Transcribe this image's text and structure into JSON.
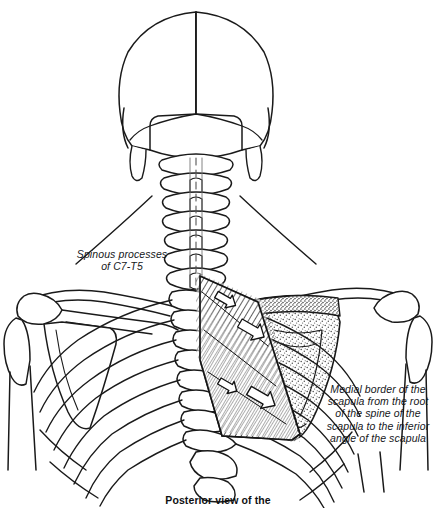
{
  "figure": {
    "view": "posterior",
    "medium": "black-and-white line drawing",
    "caption": "Posterior view of the",
    "caption_clipped": true,
    "labels": [
      {
        "id": "spinous-processes",
        "text": "Spinous processes\nof C7-T5",
        "style": "italic",
        "side": "left"
      },
      {
        "id": "medial-border",
        "text": "Medial border of the\nscapula from the root\nof the spine of the\nscapula to the inferior\nangle of the scapula",
        "style": "italic",
        "side": "right"
      }
    ],
    "structures": [
      "skull",
      "cervical vertebrae",
      "thoracic vertebrae",
      "ribs",
      "left scapula",
      "right scapula",
      "clavicle",
      "humerus",
      "rhomboid muscle"
    ],
    "muscle": {
      "name": "rhomboid",
      "rendering": "diagonal fiber hatching",
      "arrow_count": 4,
      "arrow_style": "white block arrow with black outline",
      "arrow_direction": "inferolateral, from spine toward scapula"
    },
    "shading": {
      "scapula_right": "stippled along medial border and inferior angle",
      "scapula_left": "plain outline"
    },
    "colors": {
      "background": "#ffffff",
      "ink": "#1a1a1a",
      "muscle_hatch": "#3a3a3a",
      "stipple": "#4a4a4a"
    }
  }
}
